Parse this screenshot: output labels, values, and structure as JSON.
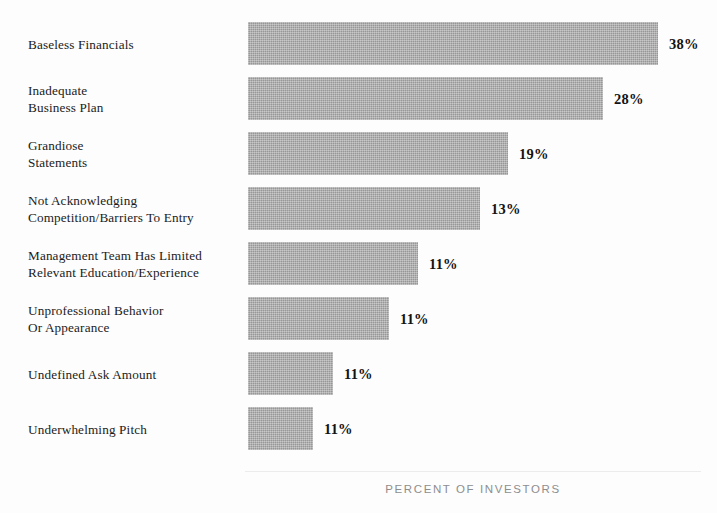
{
  "chart_data": {
    "type": "bar",
    "orientation": "horizontal",
    "title": "",
    "subtitle": "",
    "xlabel": "PERCENT OF INVESTORS",
    "ylabel": "",
    "xlim": [
      0,
      38
    ],
    "grid": false,
    "legend": null,
    "bar_color": "#a9a9a9",
    "categories": [
      "Baseless Financials",
      "Inadequate\nBusiness Plan",
      "Grandiose\nStatements",
      "Not Acknowledging\nCompetition/Barriers To Entry",
      "Management Team Has Limited\nRelevant Education/Experience",
      "Unprofessional Behavior\nOr Appearance",
      "Undefined Ask Amount",
      "Underwhelming Pitch"
    ],
    "values": [
      38,
      28,
      19,
      13,
      11,
      11,
      11,
      11
    ],
    "data_labels": [
      "38%",
      "28%",
      "19%",
      "13%",
      "11%",
      "11%",
      "11%",
      "11%"
    ],
    "bar_pixel_widths": [
      410,
      355,
      260,
      232,
      170,
      141,
      85,
      65
    ]
  },
  "axis": {
    "caption": "PERCENT OF INVESTORS"
  },
  "bars": [
    {
      "label": "Baseless Financials",
      "value_label": "38%",
      "width_px": 410,
      "top_px": 22
    },
    {
      "label": "Inadequate\nBusiness Plan",
      "value_label": "28%",
      "width_px": 355,
      "top_px": 77
    },
    {
      "label": "Grandiose\nStatements",
      "value_label": "19%",
      "width_px": 260,
      "top_px": 132
    },
    {
      "label": "Not Acknowledging\nCompetition/Barriers To Entry",
      "value_label": "13%",
      "width_px": 232,
      "top_px": 187
    },
    {
      "label": "Management Team Has Limited\nRelevant Education/Experience",
      "value_label": "11%",
      "width_px": 170,
      "top_px": 242
    },
    {
      "label": "Unprofessional Behavior\nOr Appearance",
      "value_label": "11%",
      "width_px": 141,
      "top_px": 297
    },
    {
      "label": "Undefined Ask Amount",
      "value_label": "11%",
      "width_px": 85,
      "top_px": 352
    },
    {
      "label": "Underwhelming Pitch",
      "value_label": "11%",
      "width_px": 65,
      "top_px": 407
    }
  ]
}
